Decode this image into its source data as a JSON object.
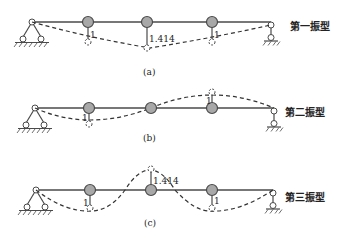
{
  "figure": {
    "modes": [
      {
        "id": "a",
        "caption": "(a)",
        "mode_label": "第一振型",
        "amplitudes": [
          {
            "value": "1",
            "direction": "down"
          },
          {
            "value": "1.414",
            "direction": "down"
          },
          {
            "value": "1",
            "direction": "down"
          }
        ]
      },
      {
        "id": "b",
        "caption": "(b)",
        "mode_label": "第二振型",
        "amplitudes": [
          {
            "value": "1",
            "direction": "down"
          },
          {
            "value": "0",
            "direction": "none"
          },
          {
            "value": "1",
            "direction": "up"
          }
        ]
      },
      {
        "id": "c",
        "caption": "(c)",
        "mode_label": "第三振型",
        "amplitudes": [
          {
            "value": "1",
            "direction": "down"
          },
          {
            "value": "1.414",
            "direction": "up"
          },
          {
            "value": "1",
            "direction": "down"
          }
        ]
      }
    ],
    "colors": {
      "line": "#4a4a4a",
      "mass_fill": "#a8a8a8",
      "dashed": "#333333"
    }
  }
}
